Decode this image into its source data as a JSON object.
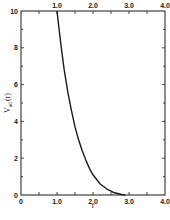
{
  "chart_data": {
    "type": "line",
    "title": "",
    "xlabel": "r",
    "ylabel": "V_ad (r)",
    "ylabel_main": "V",
    "ylabel_sub": "ad",
    "ylabel_arg": "(r)",
    "xlim": [
      0,
      4.0
    ],
    "ylim": [
      0,
      10
    ],
    "grid": false,
    "legend": null,
    "x_ticks_bottom": [
      "0",
      "1.0",
      "2.0",
      "3.0",
      "4.0"
    ],
    "x_ticks_top": [
      "1.0",
      "2.0",
      "3.0",
      "4.0"
    ],
    "y_ticks": [
      "0",
      "2",
      "4",
      "6",
      "8",
      "10"
    ],
    "series": [
      {
        "name": "V_ad(r)",
        "x": [
          1.0,
          1.1,
          1.2,
          1.3,
          1.4,
          1.5,
          1.6,
          1.7,
          1.8,
          1.9,
          2.0,
          2.2,
          2.4,
          2.6,
          2.8,
          2.9
        ],
        "y": [
          10.0,
          8.3,
          6.8,
          5.6,
          4.6,
          3.7,
          3.0,
          2.4,
          1.9,
          1.45,
          1.1,
          0.6,
          0.3,
          0.12,
          0.03,
          0.0
        ]
      }
    ]
  }
}
